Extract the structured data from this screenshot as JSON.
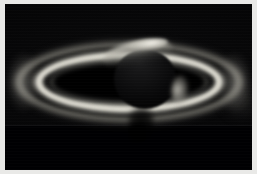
{
  "image": {
    "subject": "Saturn",
    "kind": "astronomical-photograph",
    "palette": "grayscale",
    "alt_text": "Grayscale telescopic photograph of Saturn backlit by the Sun, showing the full ring system spanning the frame, a thin sunlit crescent along the planet's upper limb, and the planet's dark silhouette against the rings.",
    "border_color": "#e9e9e7",
    "sky_color": "#000002"
  },
  "features": {
    "planet": {
      "name": "planet-disk",
      "description": "dark silhouetted globe of Saturn",
      "crescent": "sunlit crescent along upper limb",
      "flank": "sunlit crescent on right flank",
      "shadow": "planet shadow cast on near ring"
    },
    "rings": [
      {
        "name": "outer-haze",
        "label": "faint outer ring haze",
        "brightness": "very-faint"
      },
      {
        "name": "a-ring",
        "label": "A ring",
        "brightness": "moderate"
      },
      {
        "name": "cassini-division",
        "label": "Cassini division",
        "brightness": "dark-gap"
      },
      {
        "name": "b-ring",
        "label": "B ring",
        "brightness": "brightest"
      },
      {
        "name": "c-ring",
        "label": "C ring",
        "brightness": "faint"
      },
      {
        "name": "inner-void",
        "label": "inner ring void",
        "brightness": "black"
      }
    ],
    "ansae": [
      {
        "name": "left-ansa",
        "label": "left ring ansa"
      },
      {
        "name": "right-ansa",
        "label": "right ring ansa"
      }
    ],
    "sky": {
      "lower_band_label": "lower exposure band",
      "glow_label": "faint glow near right edge"
    }
  }
}
